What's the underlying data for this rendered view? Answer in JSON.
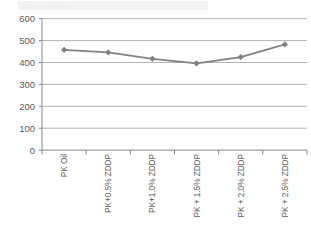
{
  "artifact": {
    "ghost_text": "scan artifact"
  },
  "chart_data": {
    "type": "line",
    "title": "",
    "subtitle": "",
    "xlabel": "",
    "ylabel": "",
    "categories": [
      "PK Oil",
      "PK+0.5% ZDDP",
      "PK+1.0% ZDDP",
      "PK + 1.5% ZDDP",
      "PK + 2.0% ZDDP",
      "PK + 2.5% ZDDP"
    ],
    "values": [
      458,
      446,
      417,
      396,
      425,
      483
    ],
    "series": [
      {
        "name": "Series 1",
        "values": [
          458,
          446,
          417,
          396,
          425,
          483
        ],
        "color": "#808080",
        "marker": "diamond"
      }
    ],
    "ylim": [
      0,
      600
    ],
    "ytick_labels": [
      "600",
      "500",
      "400",
      "300",
      "200",
      "100",
      "0"
    ],
    "ytick_values": [
      600,
      500,
      400,
      300,
      200,
      100,
      0
    ],
    "grid": true,
    "grid_color": "#b3b3b3",
    "axis_color": "#868686",
    "legend": false,
    "legend_position": "none"
  }
}
